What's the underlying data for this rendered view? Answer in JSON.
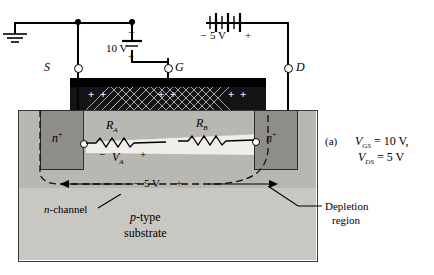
{
  "figure": {
    "caption_label": "(a)",
    "caption_lines": [
      "V",
      "GS",
      "  =  10 V,",
      "V",
      "DS",
      "  =  5 V"
    ],
    "cap_line1_var": "V",
    "cap_line1_sub": "GS",
    "cap_line1_val": "=  10 V,",
    "cap_line2_var": "V",
    "cap_line2_sub": "DS",
    "cap_line2_val": "=  5 V"
  },
  "terminals": {
    "source": "S",
    "gate": "G",
    "drain": "D"
  },
  "sources": {
    "gate_supply_value": "10 V",
    "gate_supply_minus": "−",
    "gate_supply_plus": "+",
    "drain_supply_minus": "−",
    "drain_supply_value": "5 V",
    "drain_supply_plus": "+"
  },
  "channel": {
    "left_region": "n",
    "left_region_sup": "+",
    "right_region": "n",
    "right_region_sup": "+",
    "resistor_a": "R",
    "resistor_a_sub": "A",
    "resistor_b": "R",
    "resistor_b_sub": "B",
    "va_minus": "−",
    "va_label": "V",
    "va_sub": "A",
    "va_plus": "+",
    "channel_drop_minus": "−",
    "channel_drop_value": "5 V",
    "channel_drop_plus": "+"
  },
  "labels": {
    "n_channel_var": "n",
    "n_channel_text": "-channel",
    "p_type_var": "p",
    "p_type_text": "-type",
    "substrate": "substrate",
    "depletion": "Depletion",
    "depletion2": "region"
  },
  "gate_plate": {
    "plus_signs": [
      "+",
      "+",
      "+",
      "+",
      "+",
      "+"
    ]
  },
  "colors": {
    "body_gray": "#b9b7b2",
    "substrate_gray": "#c9c7c2",
    "contact_gray": "#8f8d89",
    "black": "#000000",
    "channel_light": "#efeeec"
  }
}
